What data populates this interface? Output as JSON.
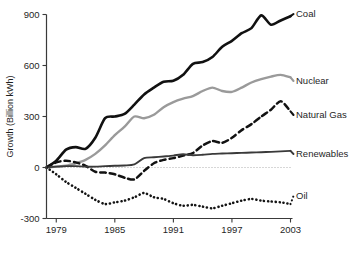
{
  "chart_data": {
    "type": "line",
    "title": "",
    "xlabel": "",
    "ylabel": "Growth (Billion kWh)",
    "xlim": [
      1978,
      2003
    ],
    "ylim": [
      -300,
      900
    ],
    "grid": "zero-line-only",
    "legend_position": "right-end-labels",
    "x_ticks": [
      "1979",
      "1985",
      "1991",
      "1997",
      "2003"
    ],
    "x_tick_values": [
      1979,
      1985,
      1991,
      1997,
      2003
    ],
    "y_ticks": [
      "900",
      "600",
      "300",
      "0",
      "-300"
    ],
    "y_tick_values": [
      900,
      600,
      300,
      0,
      -300
    ],
    "x": [
      1978,
      1979,
      1980,
      1981,
      1982,
      1983,
      1984,
      1985,
      1986,
      1987,
      1988,
      1989,
      1990,
      1991,
      1992,
      1993,
      1994,
      1995,
      1996,
      1997,
      1998,
      1999,
      2000,
      2001,
      2002,
      2003
    ],
    "series": [
      {
        "name": "Coal",
        "label": "Coal",
        "style": "solid",
        "color": "#111111",
        "width": 2.6,
        "values": [
          0,
          40,
          105,
          120,
          110,
          175,
          290,
          300,
          315,
          370,
          430,
          470,
          505,
          510,
          545,
          610,
          620,
          650,
          710,
          745,
          790,
          820,
          895,
          840,
          865,
          890
        ]
      },
      {
        "name": "Nuclear",
        "label": "Nuclear",
        "style": "solid",
        "color": "#9a9a9a",
        "width": 2.4,
        "values": [
          0,
          5,
          10,
          25,
          45,
          80,
          130,
          190,
          240,
          300,
          290,
          310,
          355,
          385,
          405,
          420,
          450,
          470,
          450,
          445,
          470,
          500,
          520,
          535,
          545,
          530
        ]
      },
      {
        "name": "Natural Gas",
        "label": "Natural Gas",
        "style": "dashed",
        "color": "#121212",
        "width": 2.5,
        "values": [
          0,
          30,
          40,
          30,
          10,
          -25,
          -30,
          -40,
          -60,
          -70,
          -20,
          25,
          45,
          55,
          70,
          85,
          130,
          155,
          145,
          175,
          220,
          255,
          300,
          340,
          390,
          330
        ]
      },
      {
        "name": "Renewables",
        "label": "Renewables",
        "style": "solid",
        "color": "#3a3a3a",
        "width": 1.9,
        "values": [
          0,
          5,
          8,
          8,
          5,
          5,
          8,
          10,
          12,
          18,
          55,
          60,
          65,
          70,
          78,
          72,
          75,
          80,
          82,
          84,
          86,
          88,
          90,
          92,
          95,
          98
        ]
      },
      {
        "name": "Oil",
        "label": "Oil",
        "style": "dotted",
        "color": "#141414",
        "width": 2.6,
        "values": [
          0,
          -40,
          -85,
          -120,
          -155,
          -190,
          -215,
          -205,
          -195,
          -175,
          -150,
          -175,
          -185,
          -210,
          -225,
          -220,
          -230,
          -240,
          -225,
          -210,
          -195,
          -185,
          -195,
          -200,
          -205,
          -215
        ]
      }
    ],
    "annotations": []
  }
}
